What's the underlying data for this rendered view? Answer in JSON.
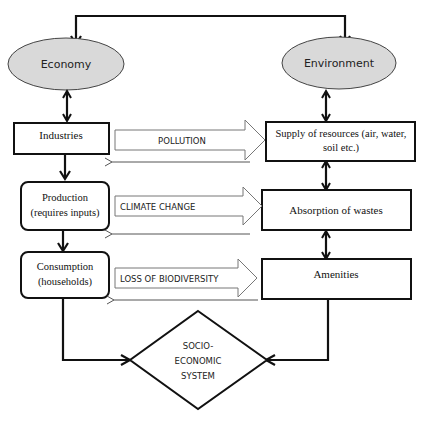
{
  "diagram": {
    "type": "flowchart",
    "colors": {
      "ellipse_fill": "#d9d9d9",
      "stroke": "#111111",
      "block_arrow_stroke": "#666666",
      "background": "#ffffff"
    },
    "nodes": {
      "economy": {
        "label": "Economy",
        "shape": "ellipse"
      },
      "environment": {
        "label": "Environment",
        "shape": "ellipse"
      },
      "industries": {
        "label": "Industries",
        "shape": "rectangle"
      },
      "production": {
        "line1": "Production",
        "line2": "(requires inputs)",
        "shape": "rounded-rectangle"
      },
      "consumption": {
        "line1": "Consumption",
        "line2": "(households)",
        "shape": "rounded-rectangle"
      },
      "supply": {
        "line1": "Supply of resources (air, water,",
        "line2": "soil etc.)",
        "shape": "rectangle"
      },
      "absorption": {
        "label": "Absorption of wastes",
        "shape": "rectangle"
      },
      "amenities": {
        "label": "Amenities",
        "shape": "rectangle"
      },
      "socio": {
        "line1": "SOCIO-",
        "line2": "ECONOMIC",
        "line3": "SYSTEM",
        "shape": "diamond"
      }
    },
    "flows": [
      {
        "label": "POLLUTION",
        "from": "industries",
        "to": "supply"
      },
      {
        "label": "CLIMATE CHANGE",
        "from": "production",
        "to": "absorption"
      },
      {
        "label": "LOSS OF BIODIVERSITY",
        "from": "consumption",
        "to": "amenities"
      }
    ]
  }
}
